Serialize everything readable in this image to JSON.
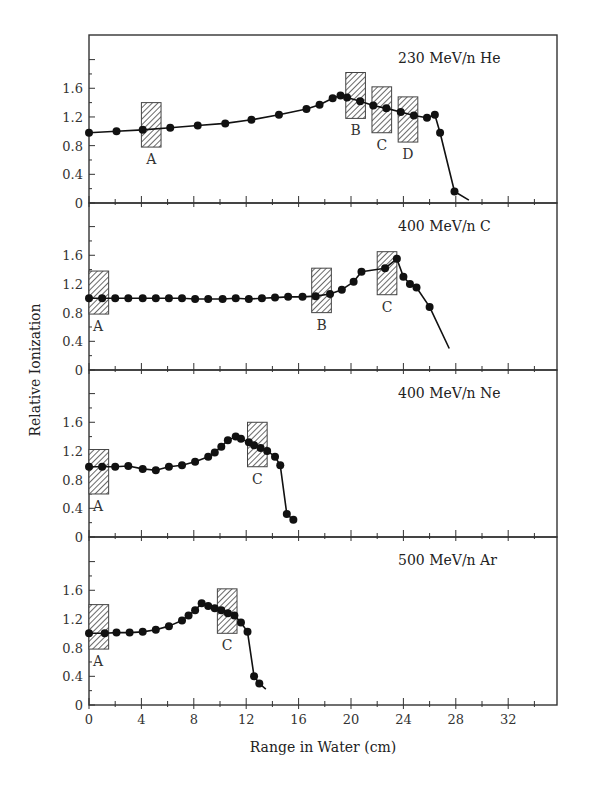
{
  "chart_data": {
    "type": "line",
    "xlabel": "Range in Water (cm)",
    "ylabel": "Relative Ionization",
    "xlim": [
      0,
      35.7
    ],
    "xticks": [
      0,
      4,
      8,
      12,
      16,
      20,
      24,
      28,
      32
    ],
    "yticks": [
      0,
      0.4,
      0.8,
      1.2,
      1.6
    ],
    "ylim": [
      0,
      2.34
    ],
    "grid": false,
    "legend": "none",
    "panels": [
      {
        "title": "230 MeV/n He",
        "x": [
          0,
          2.1,
          4.1,
          6.2,
          8.3,
          10.4,
          12.4,
          14.5,
          16.6,
          17.6,
          18.6,
          19.2,
          19.7,
          20.7,
          21.7,
          22.7,
          23.8,
          24.8,
          25.8,
          26.4,
          26.8,
          27.9
        ],
        "y": [
          0.98,
          1.0,
          1.02,
          1.05,
          1.08,
          1.11,
          1.16,
          1.23,
          1.31,
          1.37,
          1.46,
          1.5,
          1.47,
          1.42,
          1.36,
          1.32,
          1.27,
          1.22,
          1.19,
          1.23,
          0.98,
          0.16
        ],
        "curve_end": [
          29.0,
          0.04
        ],
        "boxes": [
          {
            "label": "A",
            "x0": 4.0,
            "x1": 5.5,
            "y0": 0.78,
            "y1": 1.4
          },
          {
            "label": "B",
            "x0": 19.6,
            "x1": 21.1,
            "y0": 1.18,
            "y1": 1.82
          },
          {
            "label": "C",
            "x0": 21.6,
            "x1": 23.1,
            "y0": 0.98,
            "y1": 1.62
          },
          {
            "label": "D",
            "x0": 23.6,
            "x1": 25.1,
            "y0": 0.85,
            "y1": 1.48
          }
        ]
      },
      {
        "title": "400 MeV/n C",
        "x": [
          0,
          1.0,
          2.0,
          3.0,
          4.1,
          5.1,
          6.1,
          7.1,
          8.1,
          9.1,
          10.2,
          11.2,
          12.2,
          13.2,
          14.2,
          15.2,
          16.3,
          17.3,
          18.4,
          19.3,
          20.2,
          20.8,
          22.6,
          23.5,
          24.0,
          24.5,
          25.0,
          26.0
        ],
        "y": [
          1.0,
          1.0,
          1.0,
          1.0,
          1.0,
          1.0,
          1.0,
          1.0,
          0.99,
          0.99,
          0.99,
          1.0,
          0.99,
          1.0,
          1.01,
          1.02,
          1.02,
          1.03,
          1.06,
          1.12,
          1.23,
          1.37,
          1.42,
          1.55,
          1.3,
          1.2,
          1.15,
          0.88,
          0.4,
          0.35
        ],
        "curve_end": [
          27.5,
          0.3
        ],
        "boxes": [
          {
            "label": "A",
            "x0": 0.0,
            "x1": 1.5,
            "y0": 0.78,
            "y1": 1.38
          },
          {
            "label": "B",
            "x0": 17.0,
            "x1": 18.5,
            "y0": 0.8,
            "y1": 1.42
          },
          {
            "label": "C",
            "x0": 22.0,
            "x1": 23.5,
            "y0": 1.05,
            "y1": 1.65
          }
        ]
      },
      {
        "title": "400 MeV/n Ne",
        "x": [
          0,
          1.0,
          2.0,
          3.0,
          4.1,
          5.1,
          6.1,
          7.1,
          8.1,
          9.1,
          9.6,
          10.1,
          10.6,
          11.2,
          11.6,
          12.2,
          12.6,
          13.1,
          13.6,
          14.2,
          14.6,
          15.1,
          15.6
        ],
        "y": [
          0.98,
          0.98,
          0.98,
          0.99,
          0.95,
          0.93,
          0.98,
          1.0,
          1.05,
          1.12,
          1.18,
          1.26,
          1.35,
          1.4,
          1.37,
          1.32,
          1.28,
          1.24,
          1.2,
          1.12,
          1.0,
          0.32,
          0.24
        ],
        "curve_end": [
          15.6,
          0.24
        ],
        "boxes": [
          {
            "label": "A",
            "x0": 0.0,
            "x1": 1.5,
            "y0": 0.6,
            "y1": 1.22
          },
          {
            "label": "C",
            "x0": 12.1,
            "x1": 13.6,
            "y0": 0.98,
            "y1": 1.6
          }
        ]
      },
      {
        "title": "500 MeV/n Ar",
        "x": [
          0,
          1.2,
          2.1,
          3.1,
          4.1,
          5.1,
          6.1,
          7.1,
          7.6,
          8.1,
          8.6,
          9.1,
          9.6,
          10.1,
          10.6,
          11.1,
          11.6,
          12.1,
          12.6,
          13.0
        ],
        "y": [
          1.0,
          1.0,
          1.01,
          1.01,
          1.02,
          1.05,
          1.1,
          1.18,
          1.25,
          1.32,
          1.42,
          1.38,
          1.35,
          1.32,
          1.28,
          1.25,
          1.15,
          1.02,
          0.4,
          0.3
        ],
        "curve_end": [
          13.5,
          0.22
        ],
        "boxes": [
          {
            "label": "A",
            "x0": 0.0,
            "x1": 1.5,
            "y0": 0.78,
            "y1": 1.4
          },
          {
            "label": "C",
            "x0": 9.8,
            "x1": 11.3,
            "y0": 1.0,
            "y1": 1.62
          }
        ]
      }
    ]
  }
}
